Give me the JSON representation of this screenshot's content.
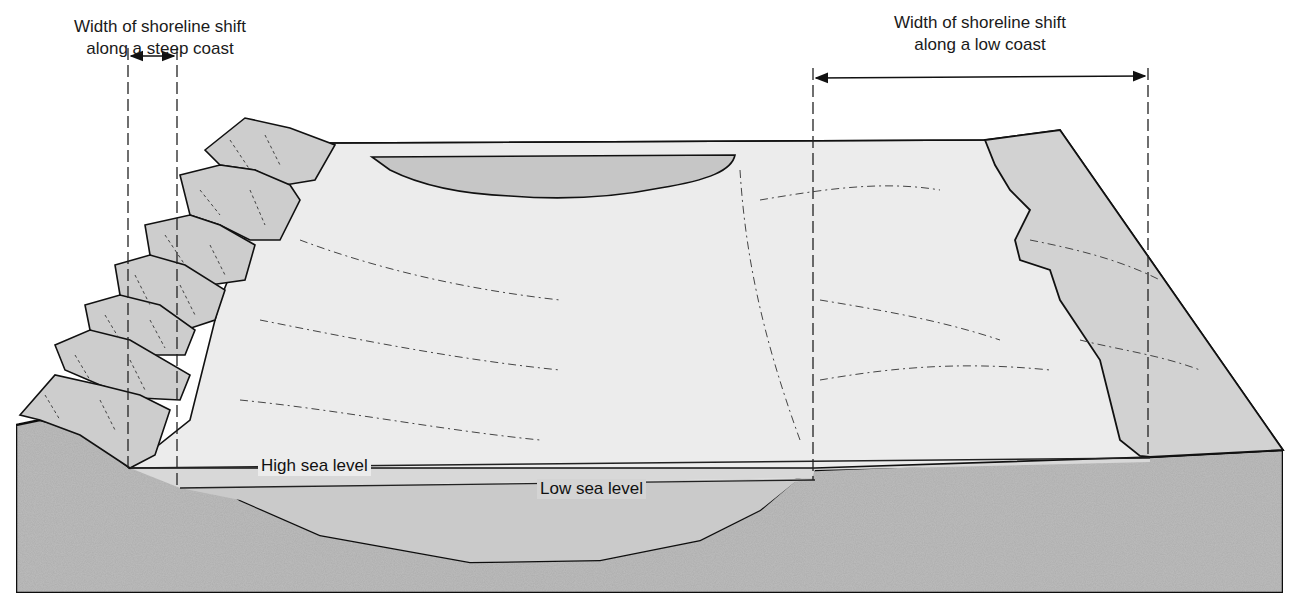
{
  "labels": {
    "steep_coast": {
      "line1": "Width of shoreline shift",
      "line2": "along a steep coast"
    },
    "low_coast": {
      "line1": "Width of shoreline shift",
      "line2": "along a low coast"
    },
    "high_sea_level": "High sea level",
    "low_sea_level": "Low sea level"
  },
  "colors": {
    "bedrock": "#bdbdbd",
    "land_surface": "#ececec",
    "rocky_cliffs": "#cfcfcf",
    "low_coast_plain": "#d4d4d4",
    "sea_high": "#d6d6d6",
    "sea_low": "#c9c9c9",
    "lake": "#c4c4c4",
    "outline": "#111111"
  },
  "dimension_markers": [
    {
      "name": "steep-coast-shift",
      "x_start": 128,
      "x_end": 177,
      "y": 56
    },
    {
      "name": "low-coast-shift",
      "x_start": 813,
      "x_end": 1148,
      "y": 78
    }
  ]
}
